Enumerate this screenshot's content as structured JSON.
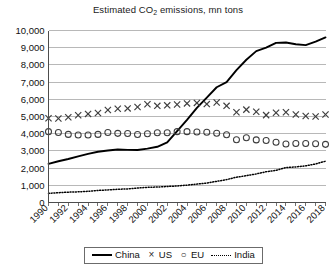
{
  "chart_data": {
    "type": "line",
    "title": "Estimated CO2 emissions, mn tons",
    "title_main": "Estimated CO",
    "title_sub": "2",
    "title_rest": " emissions, mn tons",
    "xlabel": "",
    "ylabel": "",
    "ylim": [
      0,
      10000
    ],
    "ytick_step": 1000,
    "grid": true,
    "legend_position": "bottom",
    "ytick_labels": [
      "10,000",
      "9,000",
      "8,000",
      "7,000",
      "6,000",
      "5,000",
      "4,000",
      "3,000",
      "2,000",
      "1,000",
      "0"
    ],
    "ytick_values": [
      10000,
      9000,
      8000,
      7000,
      6000,
      5000,
      4000,
      3000,
      2000,
      1000,
      0
    ],
    "x": [
      1990,
      1991,
      1992,
      1993,
      1994,
      1995,
      1996,
      1997,
      1998,
      1999,
      2000,
      2001,
      2002,
      2003,
      2004,
      2005,
      2006,
      2007,
      2008,
      2009,
      2010,
      2011,
      2012,
      2013,
      2014,
      2015,
      2016,
      2017,
      2018
    ],
    "xtick_labels": [
      "1990",
      "1992",
      "1994",
      "1996",
      "1998",
      "2000",
      "2002",
      "2004",
      "2006",
      "2008",
      "2010",
      "2012",
      "2014",
      "2016",
      "2018"
    ],
    "xtick_label_values": [
      1990,
      1992,
      1994,
      1996,
      1998,
      2000,
      2002,
      2004,
      2006,
      2008,
      2010,
      2012,
      2014,
      2016,
      2018
    ],
    "series": [
      {
        "name": "China",
        "style": "solid-line",
        "color": "#000000",
        "values": [
          2250,
          2400,
          2530,
          2680,
          2830,
          2950,
          3020,
          3080,
          3060,
          3050,
          3130,
          3240,
          3500,
          4150,
          4800,
          5500,
          6100,
          6700,
          7000,
          7700,
          8300,
          8800,
          9000,
          9280,
          9300,
          9200,
          9150,
          9350,
          9600
        ]
      },
      {
        "name": "US",
        "style": "x-markers",
        "color": "#3d3d3d",
        "values": [
          4900,
          4880,
          4960,
          5070,
          5150,
          5200,
          5380,
          5450,
          5470,
          5550,
          5710,
          5620,
          5650,
          5700,
          5760,
          5790,
          5720,
          5810,
          5620,
          5250,
          5400,
          5280,
          5080,
          5220,
          5250,
          5120,
          5030,
          5000,
          5120
        ]
      },
      {
        "name": "EU",
        "style": "o-markers",
        "color": "#3d3d3d",
        "values": [
          4120,
          4070,
          3960,
          3930,
          3930,
          3960,
          4070,
          4020,
          4010,
          3950,
          4000,
          4060,
          4050,
          4120,
          4120,
          4100,
          4090,
          4030,
          3940,
          3650,
          3760,
          3640,
          3600,
          3500,
          3400,
          3430,
          3430,
          3420,
          3380
        ]
      },
      {
        "name": "India",
        "style": "dotted-line",
        "color": "#000000",
        "values": [
          530,
          570,
          600,
          620,
          650,
          700,
          730,
          770,
          790,
          840,
          880,
          900,
          930,
          960,
          1010,
          1070,
          1130,
          1230,
          1330,
          1470,
          1560,
          1660,
          1790,
          1870,
          2030,
          2070,
          2130,
          2240,
          2400
        ]
      }
    ]
  },
  "legend": {
    "items": [
      {
        "label": "China",
        "marker": "solid-line"
      },
      {
        "label": "US",
        "marker": "x"
      },
      {
        "label": "EU",
        "marker": "o"
      },
      {
        "label": "India",
        "marker": "dotted-line"
      }
    ]
  }
}
